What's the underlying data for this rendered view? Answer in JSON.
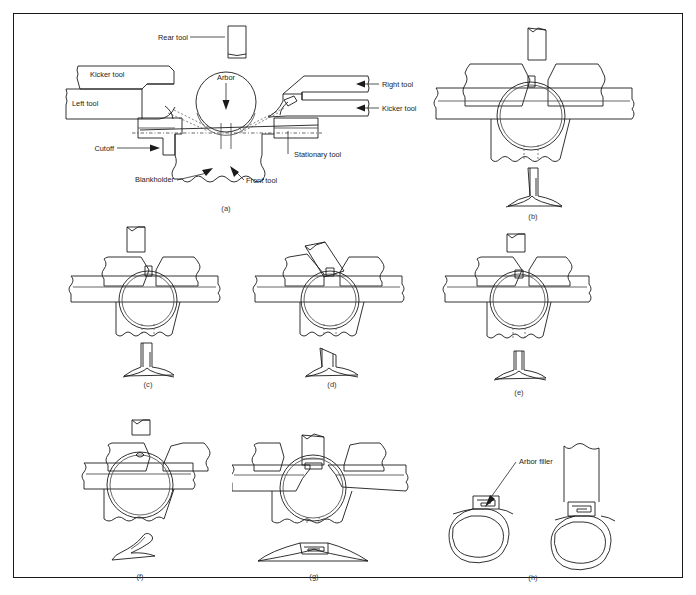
{
  "figure": {
    "border_color": "#1a1a1a",
    "line_color": "#1b1b1b",
    "background": "#ffffff"
  },
  "panels": [
    {
      "id": "a",
      "caption": "(a)"
    },
    {
      "id": "b",
      "caption": "(b)"
    },
    {
      "id": "c",
      "caption": "(c)"
    },
    {
      "id": "d",
      "caption": "(d)"
    },
    {
      "id": "e",
      "caption": "(e)"
    },
    {
      "id": "f",
      "caption": "(f)"
    },
    {
      "id": "g",
      "caption": "(g)"
    },
    {
      "id": "h",
      "caption": "(h)"
    }
  ],
  "labels": {
    "rear_tool": "Rear tool",
    "kicker_tool_left": "Kicker tool",
    "left_tool": "Left tool",
    "arbor": "Arbor",
    "right_tool": "Right tool",
    "kicker_tool_right": "Kicker tool",
    "cutoff": "Cutoff",
    "blankholder": "Blankholder",
    "front_tool": "Front tool",
    "stationary_tool": "Stationary tool",
    "arbor_filler": "Arbor filler"
  }
}
